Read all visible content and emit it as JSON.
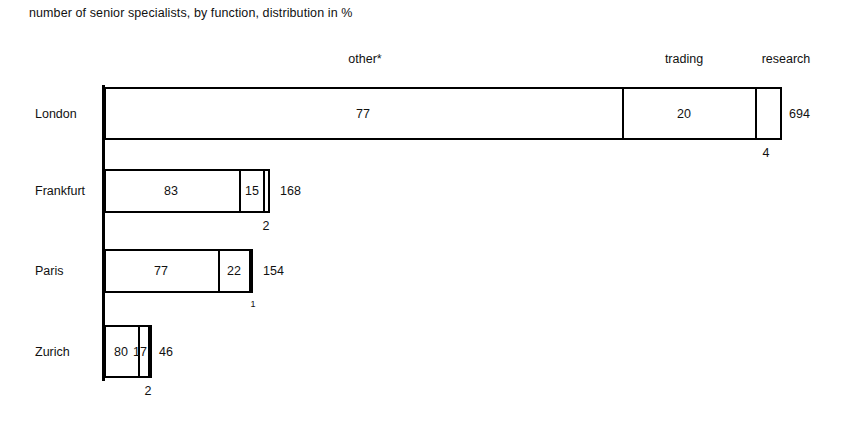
{
  "title": "number of senior specialists, by function, distribution in %",
  "footnote_marker": "*",
  "column_headers": [
    {
      "label": "other*",
      "x": 365
    },
    {
      "label": "trading",
      "x": 684
    },
    {
      "label": "research",
      "x": 786
    }
  ],
  "chart_data": {
    "type": "bar",
    "orientation": "horizontal",
    "stacked": true,
    "title": "number of senior specialists, by function, distribution in %",
    "xlabel": "",
    "ylabel": "",
    "grid": false,
    "legend_position": "top",
    "value_unit": "%",
    "categories": [
      "London",
      "Frankfurt",
      "Paris",
      "Zurich"
    ],
    "series": [
      {
        "name": "other*",
        "values": [
          77,
          83,
          77,
          80
        ]
      },
      {
        "name": "trading",
        "values": [
          20,
          15,
          22,
          17
        ]
      },
      {
        "name": "research",
        "values": [
          4,
          2,
          1,
          2
        ]
      }
    ],
    "totals": [
      694,
      168,
      154,
      46
    ],
    "totals_label": "number of senior specialists"
  },
  "rows": [
    {
      "name": "London",
      "label": "London",
      "label_x": 35,
      "top": 87,
      "height": 53,
      "left": 104,
      "width": 678,
      "total": "694",
      "total_x": 789,
      "segments": [
        {
          "name": "other",
          "label": "77",
          "start": 0,
          "end": 518,
          "show_label": true,
          "label_x": 363
        },
        {
          "name": "trading",
          "label": "20",
          "start": 518,
          "end": 651,
          "show_label": true,
          "label_x": 684
        },
        {
          "name": "research",
          "label": "4",
          "start": 651,
          "end": 678,
          "show_label": false,
          "label_x": 765
        }
      ],
      "below_labels": [
        {
          "name": "research-count",
          "text": "4",
          "x": 766,
          "y": 146,
          "tiny": false
        }
      ]
    },
    {
      "name": "Frankfurt",
      "label": "Frankfurt",
      "label_x": 35,
      "top": 169,
      "height": 44,
      "left": 104,
      "width": 166,
      "total": "168",
      "total_x": 280,
      "segments": [
        {
          "name": "other",
          "label": "83",
          "start": 0,
          "end": 135,
          "show_label": true,
          "label_x": 171
        },
        {
          "name": "trading",
          "label": "15",
          "start": 135,
          "end": 159,
          "show_label": true,
          "label_x": 252
        },
        {
          "name": "research",
          "label": "2",
          "start": 159,
          "end": 166,
          "show_label": false,
          "label_x": 266
        }
      ],
      "below_labels": [
        {
          "name": "research-count",
          "text": "2",
          "x": 266,
          "y": 219,
          "tiny": false
        }
      ]
    },
    {
      "name": "Paris",
      "label": "Paris",
      "label_x": 35,
      "top": 249,
      "height": 44,
      "left": 104,
      "width": 149,
      "total": "154",
      "total_x": 263,
      "segments": [
        {
          "name": "other",
          "label": "77",
          "start": 0,
          "end": 114,
          "show_label": true,
          "label_x": 161
        },
        {
          "name": "trading",
          "label": "22",
          "start": 114,
          "end": 145,
          "show_label": true,
          "label_x": 234
        },
        {
          "name": "research",
          "label": "1",
          "start": 145,
          "end": 149,
          "show_label": false,
          "label_x": 251
        }
      ],
      "below_labels": [
        {
          "name": "research-count",
          "text": "1",
          "x": 253,
          "y": 299,
          "tiny": true
        }
      ]
    },
    {
      "name": "Zurich",
      "label": "Zurich",
      "label_x": 35,
      "top": 325,
      "height": 53,
      "left": 104,
      "width": 48,
      "total": "46",
      "total_x": 159,
      "segments": [
        {
          "name": "other",
          "label": "80",
          "start": 0,
          "end": 34,
          "show_label": true,
          "label_x": 121
        },
        {
          "name": "trading",
          "label": "17",
          "start": 34,
          "end": 44,
          "show_label": true,
          "label_x": 140
        },
        {
          "name": "research",
          "label": "2",
          "start": 44,
          "end": 48,
          "show_label": false,
          "label_x": 149
        }
      ],
      "below_labels": [
        {
          "name": "research-count",
          "text": "2",
          "x": 148,
          "y": 384,
          "tiny": false
        }
      ]
    }
  ]
}
